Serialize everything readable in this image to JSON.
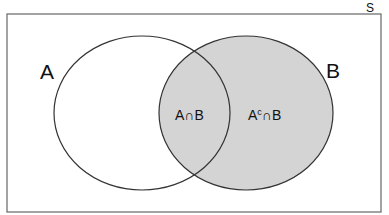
{
  "diagram": {
    "type": "venn",
    "universe_label": "S",
    "sets": [
      {
        "name": "A",
        "label": "A",
        "shaded": false
      },
      {
        "name": "B",
        "label": "B",
        "shaded": true
      }
    ],
    "regions": [
      {
        "id": "a-intersect-b",
        "label": "A∩B",
        "shaded": true
      },
      {
        "id": "a-complement-intersect-b",
        "label_base": "A",
        "label_sup": "c",
        "label_rest": "∩B",
        "shaded": true
      }
    ],
    "colors": {
      "shade": "#d4d4d4",
      "stroke": "#333333",
      "frame": "#555555"
    }
  }
}
